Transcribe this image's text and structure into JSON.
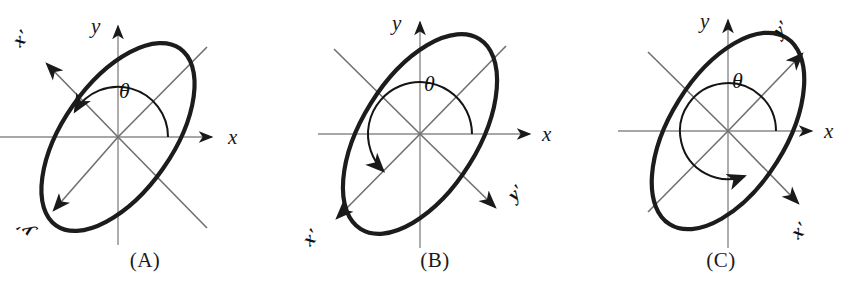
{
  "figure": {
    "width": 862,
    "height": 281,
    "background_color": "#ffffff",
    "ink_color": "#1a1a1a",
    "ellipse_stroke_color": "#1c1c1c",
    "axis_color": "#8a8a8a"
  },
  "panels": [
    {
      "id": "A",
      "caption": "(A)",
      "origin": {
        "x": 118,
        "y": 137
      },
      "axes": {
        "x_label": "x",
        "y_label": "y",
        "x_prime_label": "x'",
        "y_prime_label": "y'"
      },
      "angle_label": "θ",
      "angle_degrees": 145,
      "rotation_direction": "counterclockwise",
      "ellipse": {
        "major_radius": 108,
        "minor_radius": 55,
        "tilt_degrees": -55
      },
      "prime_axis_placement": {
        "x_prime": "upper-left",
        "y_prime": "lower-left"
      }
    },
    {
      "id": "B",
      "caption": "(B)",
      "origin": {
        "x": 420,
        "y": 134
      },
      "axes": {
        "x_label": "x",
        "y_label": "y",
        "x_prime_label": "x'",
        "y_prime_label": "y'"
      },
      "angle_label": "θ",
      "angle_degrees": 225,
      "rotation_direction": "counterclockwise",
      "ellipse": {
        "major_radius": 112,
        "minor_radius": 58,
        "tilt_degrees": -58
      },
      "prime_axis_placement": {
        "x_prime": "lower-left",
        "y_prime": "lower-right"
      }
    },
    {
      "id": "C",
      "caption": "(C)",
      "origin": {
        "x": 728,
        "y": 131
      },
      "axes": {
        "x_label": "x",
        "y_label": "y",
        "x_prime_label": "x'",
        "y_prime_label": "y'"
      },
      "angle_label": "θ",
      "angle_degrees": 290,
      "rotation_direction": "counterclockwise",
      "ellipse": {
        "major_radius": 110,
        "minor_radius": 58,
        "tilt_degrees": -58
      },
      "prime_axis_placement": {
        "x_prime": "lower-right",
        "y_prime": "upper-right"
      }
    }
  ]
}
